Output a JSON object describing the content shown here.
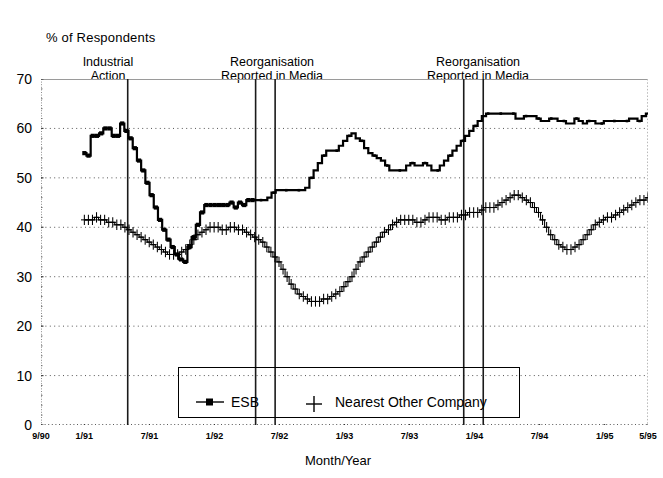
{
  "chart_data": {
    "type": "line",
    "title": "",
    "ylabel": "% of Respondents",
    "xlabel": "Month/Year",
    "ylim": [
      0,
      70
    ],
    "yticks": [
      0,
      10,
      20,
      30,
      40,
      50,
      60,
      70
    ],
    "grid": true,
    "grid_style": "dotted horizontal gridlines",
    "legend_position": "inside bottom-centre, boxed",
    "xtick_labels": [
      "9/90",
      "1/91",
      "7/91",
      "1/92",
      "7/92",
      "1/93",
      "7/93",
      "1/94",
      "7/94",
      "1/95",
      "5/95"
    ],
    "xtick_positions_months": [
      0,
      4,
      10,
      16,
      22,
      28,
      34,
      40,
      46,
      52,
      56
    ],
    "x_label_unit": "month",
    "x_range_months": [
      0,
      56
    ],
    "annotations": [
      {
        "label_line1": "Industrial",
        "label_line2": "Action",
        "lines_at_months": [
          8
        ]
      },
      {
        "label_line1": "Reorganisation",
        "label_line2": "Reported in Media",
        "lines_at_months": [
          19.8,
          21.6
        ]
      },
      {
        "label_line1": "Reorganisation",
        "label_line2": "Reported in Media",
        "lines_at_months": [
          39.0,
          40.8
        ]
      }
    ],
    "series": [
      {
        "name": "ESB",
        "marker": "square",
        "color": "#000000",
        "x_start_month": 4,
        "values": [
          55,
          54.5,
          58.5,
          58.5,
          59,
          60,
          60,
          58.5,
          58.5,
          61,
          59.5,
          58,
          56,
          53.5,
          51.5,
          49,
          46.5,
          44,
          41.5,
          39.5,
          37.5,
          36,
          34.5,
          33.5,
          33,
          36,
          38,
          40.5,
          43,
          44.5,
          44.5,
          44.5,
          44.5,
          44.5,
          44.5,
          45,
          44,
          45,
          44.5,
          45.5,
          45.5,
          45.5,
          45.5,
          45.5,
          46,
          47,
          47.5,
          47.5,
          47.5,
          47.5,
          47.5,
          47.5,
          47.5,
          48,
          50,
          51.5,
          53,
          54.5,
          55.5,
          55.5,
          55.5,
          56.5,
          57.5,
          58.5,
          59,
          58,
          57.5,
          56,
          55,
          54.5,
          54,
          53.5,
          52.5,
          51.5,
          51.5,
          51.5,
          51.5,
          52.5,
          53,
          52.5,
          52.5,
          53,
          52.5,
          51.5,
          51.5,
          52.5,
          53.5,
          54.5,
          55.5,
          56.5,
          57.5,
          58.5,
          59.5,
          60.5,
          61.5,
          62.5,
          63,
          63,
          63,
          63,
          63,
          63,
          63,
          62,
          62,
          62.5,
          62.5,
          62.5,
          62,
          61.5,
          61.5,
          62,
          62,
          61.5,
          61.5,
          61,
          61,
          62,
          61.5,
          61,
          61.5,
          61.5,
          61,
          61,
          61.5,
          61.5,
          61.5,
          61.5,
          61.5,
          61.5,
          62,
          62,
          61.5,
          62.5,
          63
        ]
      },
      {
        "name": "Nearest Other Company",
        "marker": "plus",
        "color": "#000000",
        "x_start_month": 4,
        "values": [
          41.5,
          41.5,
          41.5,
          42,
          41.5,
          41.5,
          41,
          41,
          40.5,
          40.5,
          40,
          39.5,
          39,
          38.5,
          38,
          37.5,
          37,
          36.5,
          36,
          35.5,
          35,
          34.5,
          34.5,
          34.5,
          35,
          35.5,
          36.5,
          37.5,
          38.5,
          39,
          39.5,
          40,
          40,
          40,
          39.5,
          39.5,
          40,
          40,
          39.5,
          39.5,
          39,
          38.5,
          38,
          37.5,
          37,
          36,
          35,
          34,
          33,
          31.5,
          30,
          28.5,
          27.5,
          26.5,
          26,
          25.5,
          25,
          25,
          25,
          25.5,
          25.5,
          26,
          26.5,
          27,
          28,
          29,
          30,
          31.5,
          33,
          34,
          35,
          36,
          37,
          38,
          39,
          39.5,
          40.5,
          41,
          41.5,
          41.5,
          41.5,
          41.5,
          41,
          41,
          41.5,
          42,
          42,
          42,
          41.5,
          41.5,
          42,
          42,
          42,
          42.5,
          42.5,
          43,
          43,
          43,
          43.5,
          44,
          44,
          44,
          44.5,
          45,
          45.5,
          46,
          46.5,
          46.5,
          46,
          45.5,
          45,
          44,
          43,
          41.5,
          40,
          38.5,
          37.5,
          36.5,
          36,
          35.5,
          35.5,
          36,
          36.5,
          37.5,
          38.5,
          39.5,
          40.5,
          41,
          41.5,
          42,
          42,
          42.5,
          43,
          43.5,
          44,
          44.5,
          45,
          45.5,
          45.5,
          46
        ]
      }
    ]
  },
  "axis": {
    "yticks": [
      "70",
      "60",
      "50",
      "40",
      "30",
      "20",
      "10",
      "0"
    ],
    "ylabel": "% of Respondents",
    "xlabel": "Month/Year",
    "xticks": [
      "9/90",
      "1/91",
      "7/91",
      "1/92",
      "7/92",
      "1/93",
      "7/93",
      "1/94",
      "7/94",
      "1/95",
      "5/95"
    ]
  },
  "annotations": [
    {
      "line1": "Industrial",
      "line2": "Action"
    },
    {
      "line1": "Reorganisation",
      "line2": "Reported in Media"
    },
    {
      "line1": "Reorganisation",
      "line2": "Reported in Media"
    }
  ],
  "legend": {
    "entries": [
      {
        "label": "ESB",
        "marker": "square-line-marker"
      },
      {
        "label": "Nearest Other Company",
        "marker": "plus-marker"
      }
    ]
  }
}
